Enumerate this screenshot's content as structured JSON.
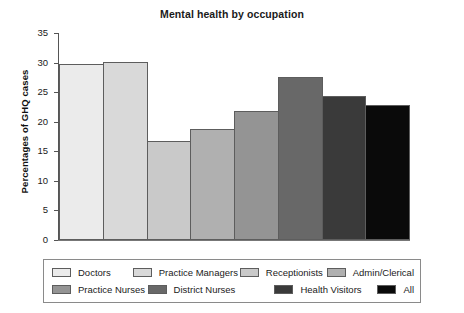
{
  "chart_data": {
    "type": "bar",
    "title": "Mental health by occupation",
    "xlabel": "",
    "ylabel": "Percentages of GHQ cases",
    "ylim": [
      0,
      35
    ],
    "ytick_step": 5,
    "yticks": [
      "35",
      "30",
      "25",
      "20",
      "15",
      "10",
      "5",
      "0"
    ],
    "grid": false,
    "legend_position": "bottom",
    "categories": [
      "Doctors",
      "Practice Managers",
      "Receptionists",
      "Admin/Clerical",
      "Practice Nurses",
      "District Nurses",
      "Health Visitors",
      "All"
    ],
    "values": [
      29.8,
      30.1,
      16.8,
      18.8,
      21.8,
      27.6,
      24.3,
      22.9
    ],
    "colors": [
      "#ebebeb",
      "#d9d9d9",
      "#c9c9c9",
      "#b0b0b0",
      "#949494",
      "#686868",
      "#3a3a3a",
      "#0a0a0a"
    ],
    "series": [
      {
        "name": "Percentages of GHQ cases",
        "values": [
          29.8,
          30.1,
          16.8,
          18.8,
          21.8,
          27.6,
          24.3,
          22.9
        ]
      }
    ]
  },
  "legend": {
    "rows": [
      [
        {
          "label": "Doctors",
          "color": "#ebebeb"
        },
        {
          "label": "Practice Managers",
          "color": "#d9d9d9"
        },
        {
          "label": "Receptionists",
          "color": "#c9c9c9"
        },
        {
          "label": "Admin/Clerical",
          "color": "#b0b0b0"
        }
      ],
      [
        {
          "label": "Practice Nurses",
          "color": "#949494"
        },
        {
          "label": "District Nurses",
          "color": "#686868"
        },
        {
          "label": "Health Visitors",
          "color": "#3a3a3a"
        },
        {
          "label": "All",
          "color": "#0a0a0a"
        }
      ]
    ]
  }
}
